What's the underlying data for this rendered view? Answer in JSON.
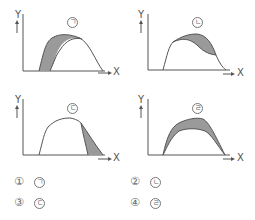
{
  "panels": [
    {
      "id": "a",
      "marker": "ㄱ",
      "y_label": "Y",
      "x_label": "X",
      "shaded_region": "left side (rising portion) between two curves"
    },
    {
      "id": "b",
      "marker": "ㄴ",
      "y_label": "Y",
      "x_label": "X",
      "shaded_region": "upper middle-right band between two curves"
    },
    {
      "id": "c",
      "marker": "ㄷ",
      "y_label": "Y",
      "x_label": "X",
      "shaded_region": "right side (falling portion) between two curves"
    },
    {
      "id": "d",
      "marker": "ㄹ",
      "y_label": "Y",
      "x_label": "X",
      "shaded_region": "entire arch band between two curves"
    }
  ],
  "choices": [
    {
      "number": "①",
      "label": "ㄱ"
    },
    {
      "number": "②",
      "label": "ㄴ"
    },
    {
      "number": "③",
      "label": "ㄷ"
    },
    {
      "number": "④",
      "label": "ㄹ"
    }
  ],
  "colors": {
    "line": "#555555",
    "shade": "#9a9a9a",
    "background": "#ffffff"
  }
}
